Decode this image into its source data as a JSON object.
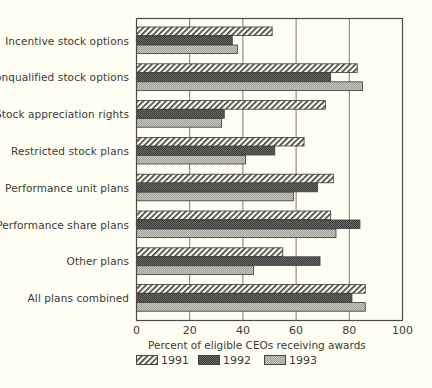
{
  "chart_data": {
    "type": "bar",
    "orientation": "horizontal",
    "title": "",
    "categories": [
      "Incentive stock options",
      "Nonqualified stock options",
      "Stock appreciation rights",
      "Restricted stock plans",
      "Performance unit plans",
      "Performance share plans",
      "Other plans",
      "All plans combined"
    ],
    "series": [
      {
        "name": "1991",
        "pattern": "diagonal-hatch",
        "values": [
          51,
          83,
          71,
          63,
          74,
          73,
          55,
          86
        ]
      },
      {
        "name": "1992",
        "pattern": "dark-dither",
        "values": [
          36,
          73,
          33,
          52,
          68,
          84,
          69,
          81
        ]
      },
      {
        "name": "1993",
        "pattern": "light-dither",
        "values": [
          38,
          85,
          32,
          41,
          59,
          75,
          44,
          86
        ]
      }
    ],
    "xlabel": "Percent of eligible CEOs receiving awards",
    "ylabel": "",
    "xlim": [
      0,
      100
    ],
    "xticks": [
      "0",
      "20",
      "40",
      "60",
      "80",
      "100"
    ],
    "grid": "vertical",
    "legend_position": "bottom-left"
  },
  "legend": [
    {
      "label": "1991",
      "pattern": "diagonal-hatch"
    },
    {
      "label": "1992",
      "pattern": "dark-dither"
    },
    {
      "label": "1993",
      "pattern": "light-dither"
    }
  ],
  "colors": {
    "background": "#fffef2",
    "frame": "#4a4a4a",
    "gridline": "#7a7a7a",
    "series_1991_fill": "#fffef2",
    "series_1991_hatch": "#3a3a3a",
    "series_1992_fill": "#5a5a58",
    "series_1993_fill": "#b9b9b2"
  }
}
